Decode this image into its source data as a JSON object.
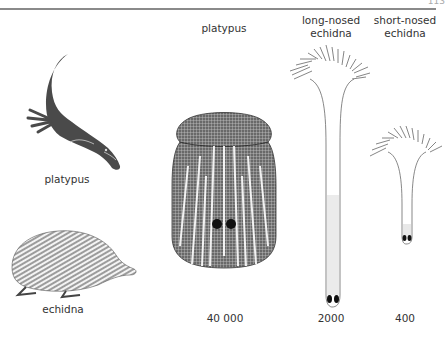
{
  "header": {
    "page_number": "113"
  },
  "animals": {
    "platypus_label": "platypus",
    "echidna_label": "echidna"
  },
  "columns": [
    {
      "title": "platypus",
      "value": "40 000"
    },
    {
      "title_line1": "long-nosed",
      "title_line2": "echidna",
      "value": "2000"
    },
    {
      "title_line1": "short-nosed",
      "title_line2": "echidna",
      "value": "400"
    }
  ],
  "colors": {
    "platypus_body": "#4a4a4a",
    "ink": "#333333",
    "rule": "#8a8a8a"
  }
}
